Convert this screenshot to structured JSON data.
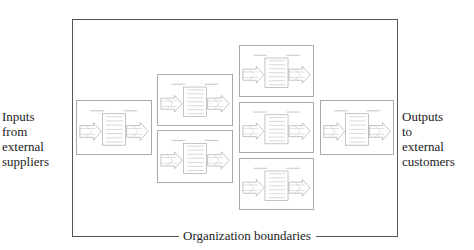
{
  "diagram": {
    "inputs_label": [
      "Inputs",
      "from",
      "external",
      "suppliers"
    ],
    "outputs_label": [
      "Outputs",
      "to",
      "external",
      "customers"
    ],
    "boundary_label": "Organization boundaries",
    "processes": [
      {
        "id": "p1",
        "x": 76,
        "y": 100,
        "w": 76,
        "h": 55
      },
      {
        "id": "p2",
        "x": 157,
        "y": 74,
        "w": 76,
        "h": 52
      },
      {
        "id": "p3",
        "x": 157,
        "y": 130,
        "w": 76,
        "h": 53
      },
      {
        "id": "p4",
        "x": 239,
        "y": 45,
        "w": 75,
        "h": 52
      },
      {
        "id": "p5",
        "x": 239,
        "y": 102,
        "w": 75,
        "h": 51
      },
      {
        "id": "p6",
        "x": 239,
        "y": 158,
        "w": 75,
        "h": 52
      },
      {
        "id": "p7",
        "x": 320,
        "y": 100,
        "w": 74,
        "h": 55
      }
    ],
    "colors": {
      "border": "#555555",
      "process_border": "#aaaaaa",
      "process_lines": "#bbbbbb"
    }
  }
}
